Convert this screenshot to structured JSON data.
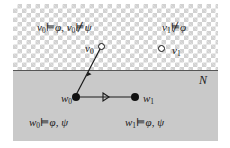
{
  "figure": {
    "type": "kripke-model-diagram",
    "regions": {
      "upper": {
        "name": "non-normal-worlds-region",
        "fill": "#ffffff",
        "pattern": "checkerboard",
        "pattern_color": "#d2d2d2"
      },
      "lower": {
        "name": "normal-worlds-region",
        "fill": "#c9c9c9"
      },
      "divider_label": "N",
      "divider_color": "#555555"
    },
    "annotations": {
      "top_left": {
        "parts": [
          "v",
          "0",
          " ⊨ ",
          "φ",
          ", ",
          "v",
          "0",
          " ⊭ ",
          "ψ"
        ],
        "world": "v",
        "world_sub": "0",
        "sat_op": "⊨",
        "sat_formula": "φ",
        "comma": ", ",
        "unsat_op": "⊭",
        "unsat_formula": "ψ"
      },
      "top_right": {
        "world": "v",
        "world_sub": "1",
        "unsat_op": "⊭",
        "unsat_formula": "φ"
      },
      "bottom_left": {
        "world": "w",
        "world_sub": "0",
        "sat_op": "⊨",
        "formula_1": "φ",
        "comma": ", ",
        "formula_2": "ψ"
      },
      "bottom_right": {
        "world": "w",
        "world_sub": "1",
        "sat_op": "⊨",
        "formula_1": "φ",
        "comma": ", ",
        "formula_2": "ψ"
      }
    },
    "nodes": [
      {
        "id": "v0",
        "label": "v",
        "sub": "0",
        "style": "open-circle",
        "region": "upper",
        "x": 88,
        "y": 42,
        "label_side": "left"
      },
      {
        "id": "v1",
        "label": "v",
        "sub": "1",
        "style": "open-circle",
        "region": "upper",
        "x": 148,
        "y": 44,
        "label_side": "right"
      },
      {
        "id": "w0",
        "label": "w",
        "sub": "0",
        "style": "filled-circle",
        "region": "lower",
        "x": 63,
        "y": 93,
        "label_side": "left"
      },
      {
        "id": "w1",
        "label": "w",
        "sub": "1",
        "style": "filled-circle",
        "region": "lower",
        "x": 122,
        "y": 93,
        "label_side": "right"
      }
    ],
    "edges": [
      {
        "name": "edge-w0-to-v0",
        "from": "w0",
        "to": "v0",
        "arrowhead": "midpoint",
        "color": "#1a1a1a"
      },
      {
        "name": "edge-w0-to-w1",
        "from": "w0",
        "to": "w1",
        "arrowhead": "midpoint",
        "color": "#1a1a1a"
      }
    ]
  }
}
